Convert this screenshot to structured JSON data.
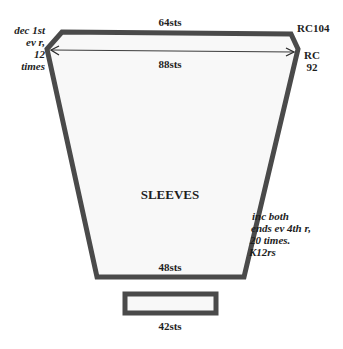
{
  "diagram": {
    "title": "SLEEVES",
    "colors": {
      "outline": "#4a4a4a",
      "fill": "#f8f8f8",
      "text": "#1e1e1e",
      "background": "#ffffff"
    },
    "labels": {
      "top_width": "64sts",
      "upper_width": "88sts",
      "bottom_width": "48sts",
      "cuff_width": "42sts",
      "row_count_top": "RC104",
      "row_count_shoulder_line1": "RC",
      "row_count_shoulder_line2": "92",
      "decrease_note": [
        "dec 1st",
        "ev r,",
        "12",
        "times"
      ],
      "increase_note": [
        "inc both",
        "ends ev 4th r,",
        "20 times.",
        "K12rs"
      ]
    }
  }
}
